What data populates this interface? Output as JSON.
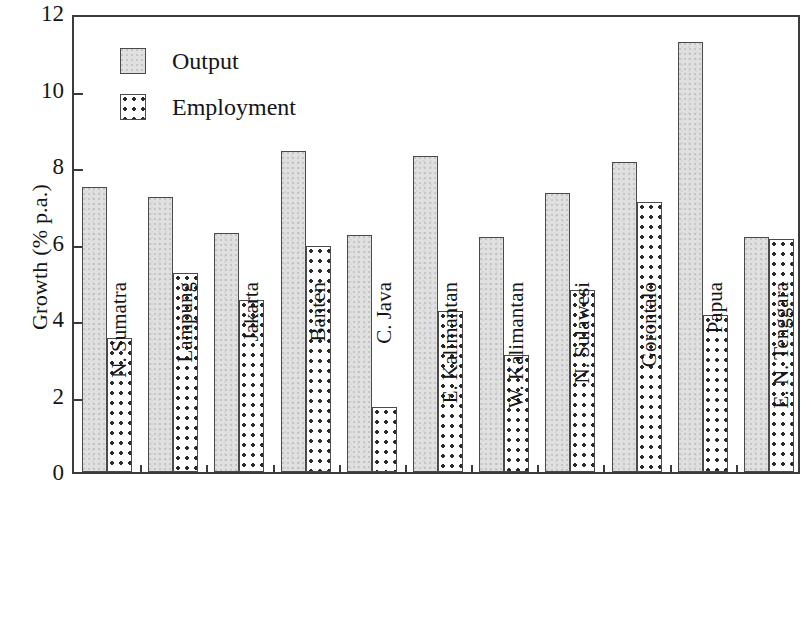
{
  "chart_data": {
    "type": "bar",
    "title": "",
    "xlabel": "",
    "ylabel": "Growth (% p.a.)",
    "ylim": [
      0,
      12
    ],
    "yticks": [
      0,
      2,
      4,
      6,
      8,
      10,
      12
    ],
    "ytick_labels": [
      "0",
      "2",
      "4",
      "6",
      "8",
      "10",
      "12"
    ],
    "grid": false,
    "legend_position": "top-left",
    "categories": [
      "N. Sumatra",
      "Lampung",
      "Jakarta",
      "Banten",
      "C. Java",
      "E. Kalimantan",
      "W. Kalimantan",
      "N. Sulawesi",
      "Gorontalo",
      "Papua",
      "E. N. Tenggara"
    ],
    "series": [
      {
        "name": "Output",
        "fill": "gray-stipple",
        "color": "#e0e0e0",
        "values": [
          7.45,
          7.2,
          6.25,
          8.4,
          6.2,
          8.25,
          6.15,
          7.3,
          8.1,
          11.25,
          6.15
        ]
      },
      {
        "name": "Employment",
        "fill": "white-dotted",
        "color": "#ffffff",
        "values": [
          3.5,
          5.2,
          4.5,
          5.9,
          1.7,
          4.2,
          3.05,
          4.75,
          7.05,
          4.1,
          6.1
        ]
      }
    ]
  },
  "legend": {
    "items": [
      {
        "label": "Output",
        "style": "output"
      },
      {
        "label": "Employment",
        "style": "employment"
      }
    ]
  },
  "axes": {
    "y_title": "Growth (% p.a.)"
  }
}
